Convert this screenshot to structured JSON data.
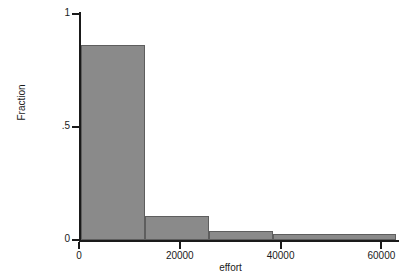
{
  "chart_data": {
    "type": "bar",
    "title": "",
    "xlabel": "effort",
    "ylabel": "Fraction",
    "xlim": [
      0,
      63500
    ],
    "ylim": [
      0,
      1
    ],
    "grid": false,
    "legend": null,
    "x_ticks": [
      {
        "value": 0,
        "label": "0"
      },
      {
        "value": 20000,
        "label": "20000"
      },
      {
        "value": 40000,
        "label": "40000"
      },
      {
        "value": 60000,
        "label": "60000"
      }
    ],
    "y_ticks": [
      {
        "value": 0,
        "label": "0"
      },
      {
        "value": 0.5,
        "label": ".5"
      },
      {
        "value": 1,
        "label": "1"
      }
    ],
    "bars": [
      {
        "bin_start": 400,
        "bin_end": 13100,
        "value": 0.865
      },
      {
        "bin_start": 13100,
        "bin_end": 25800,
        "value": 0.106
      },
      {
        "bin_start": 25800,
        "bin_end": 38500,
        "value": 0.04
      },
      {
        "bin_start": 38500,
        "bin_end": 63000,
        "value": 0.026
      }
    ],
    "categories": [
      "0-13100",
      "13100-25800",
      "25800-38500",
      "38500-63000"
    ],
    "values": [
      0.865,
      0.106,
      0.04,
      0.026
    ],
    "colors": {
      "bar_fill": "#8a8a8a",
      "bar_stroke": "#5e5e5e",
      "axis": "#1a1a1a",
      "background": "#ffffff"
    }
  }
}
